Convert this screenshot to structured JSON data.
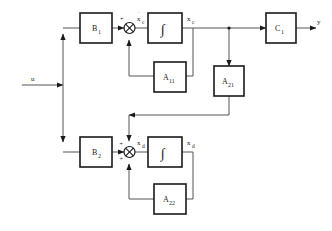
{
  "diagram": {
    "type": "control-system-block-diagram",
    "background_color": "#ffffff",
    "line_color": "#555555",
    "block_border_color": "#1a1a1a",
    "text_color": "#1a1a1a"
  },
  "signals": {
    "input": "u",
    "output": "y",
    "xc_dot_base": "x",
    "xc_dot_sub": "c",
    "xc_base": "x",
    "xc_sub": "c",
    "xd_dot_base": "x",
    "xd_dot_sub": "d",
    "xd_base": "x",
    "xd_sub": "d"
  },
  "blocks": [
    {
      "id": "B1",
      "base": "B",
      "sub": "1",
      "label": "B1"
    },
    {
      "id": "B2",
      "base": "B",
      "sub": "2",
      "label": "B2"
    },
    {
      "id": "C1",
      "base": "C",
      "sub": "1",
      "label": "C1"
    },
    {
      "id": "A11",
      "base": "A",
      "sub": "11",
      "label": "A11"
    },
    {
      "id": "A21",
      "base": "A",
      "sub": "21",
      "label": "A21"
    },
    {
      "id": "A22",
      "base": "A",
      "sub": "22",
      "label": "A22"
    },
    {
      "id": "INT1",
      "base": "∫",
      "sub": "",
      "label": "integrator-upper"
    },
    {
      "id": "INT2",
      "base": "∫",
      "sub": "",
      "label": "integrator-lower"
    }
  ],
  "summing_junctions": [
    {
      "id": "sum-upper",
      "signs": [
        "+"
      ]
    },
    {
      "id": "sum-lower",
      "signs": [
        "+",
        "+"
      ]
    }
  ]
}
